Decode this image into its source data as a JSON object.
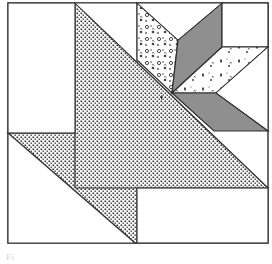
{
  "diagram": {
    "type": "quilt-block-pattern",
    "colors": {
      "outline": "#3a3a3a",
      "background": "#ffffff",
      "stipple_fill": "#b9b9b9",
      "stipple_dot": "#2e2e2e",
      "grey_diamond": "#8f8f8f",
      "floral_dot": "#444444"
    },
    "pieces": [
      {
        "id": "white-rect-top-left",
        "fill": "white"
      },
      {
        "id": "large-stippled-triangle",
        "fill": "stipple"
      },
      {
        "id": "white-triangle-top",
        "fill": "white"
      },
      {
        "id": "white-triangle-bottom-left",
        "fill": "white"
      },
      {
        "id": "white-rect-bottom-right",
        "fill": "white"
      },
      {
        "id": "floral-diamond",
        "fill": "floral-print"
      },
      {
        "id": "grey-diamond-upper",
        "fill": "grey"
      },
      {
        "id": "sprig-diamond",
        "fill": "sprig-print"
      },
      {
        "id": "grey-diamond-lower",
        "fill": "grey"
      },
      {
        "id": "white-square-top-right",
        "fill": "white"
      },
      {
        "id": "white-triangle-right",
        "fill": "white"
      }
    ]
  },
  "caption": {
    "text": "Fi"
  }
}
